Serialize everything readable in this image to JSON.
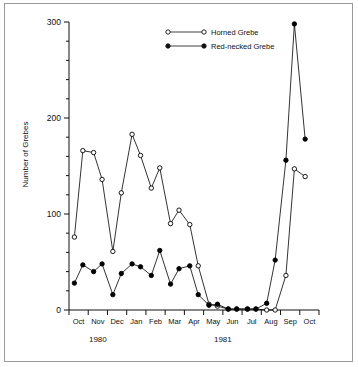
{
  "chart_data": {
    "type": "line",
    "title": "",
    "xlabel": "",
    "ylabel": "Number of Grebes",
    "ylim": [
      0,
      300
    ],
    "yticks": [
      0,
      100,
      200,
      300
    ],
    "ytick_labels": [
      "0",
      "100",
      "200",
      "300"
    ],
    "minor_tick_interval": 20,
    "grid": false,
    "legend_position": "top-center",
    "x_axis_type": "semi-monthly",
    "month_labels": [
      "Oct",
      "Nov",
      "Dec",
      "Jan",
      "Feb",
      "Mar",
      "Apr",
      "May",
      "Jun",
      "Jul",
      "Aug",
      "Sep",
      "Oct"
    ],
    "year_groups": [
      {
        "label": "1980",
        "months": [
          "Oct",
          "Nov",
          "Dec"
        ]
      },
      {
        "label": "1981",
        "months": [
          "Jan",
          "Feb",
          "Mar",
          "Apr",
          "May",
          "Jun",
          "Jul",
          "Aug",
          "Sep",
          "Oct"
        ]
      }
    ],
    "series": [
      {
        "name": "Horned Grebe",
        "marker": "open-circle",
        "color": "#000000",
        "x": [
          "Oct-1",
          "Oct-2",
          "Nov-1",
          "Nov-2",
          "Dec-1",
          "Dec-2",
          "Jan-1",
          "Jan-2",
          "Feb-1",
          "Feb-2",
          "Mar-1",
          "Mar-2",
          "Apr-1",
          "Apr-2",
          "May-1",
          "May-2",
          "Jun-1",
          "Jun-2",
          "Jul-1",
          "Jul-2",
          "Aug-1",
          "Aug-2",
          "Sep-1",
          "Sep-2",
          "Oct-1"
        ],
        "values": [
          76,
          166,
          164,
          136,
          61,
          122,
          183,
          161,
          127,
          148,
          90,
          104,
          89,
          46,
          6,
          4,
          1,
          1,
          1,
          1,
          0,
          0,
          36,
          147,
          139
        ]
      },
      {
        "name": "Red-necked Grebe",
        "marker": "filled-circle",
        "color": "#000000",
        "x": [
          "Oct-1",
          "Oct-2",
          "Nov-1",
          "Nov-2",
          "Dec-1",
          "Dec-2",
          "Jan-1",
          "Jan-2",
          "Feb-1",
          "Feb-2",
          "Mar-1",
          "Mar-2",
          "Apr-1",
          "Apr-2",
          "May-1",
          "May-2",
          "Jun-1",
          "Jun-2",
          "Jul-1",
          "Jul-2",
          "Aug-1",
          "Aug-2",
          "Sep-1",
          "Sep-2",
          "Oct-1"
        ],
        "values": [
          28,
          47,
          40,
          48,
          16,
          38,
          48,
          45,
          36,
          62,
          27,
          43,
          46,
          16,
          5,
          6,
          1,
          1,
          1,
          1,
          7,
          52,
          156,
          298,
          178
        ]
      }
    ]
  },
  "legend": {
    "items": [
      {
        "label": "Horned Grebe",
        "marker": "open-circle"
      },
      {
        "label": "Red-necked Grebe",
        "marker": "filled-circle"
      }
    ]
  }
}
